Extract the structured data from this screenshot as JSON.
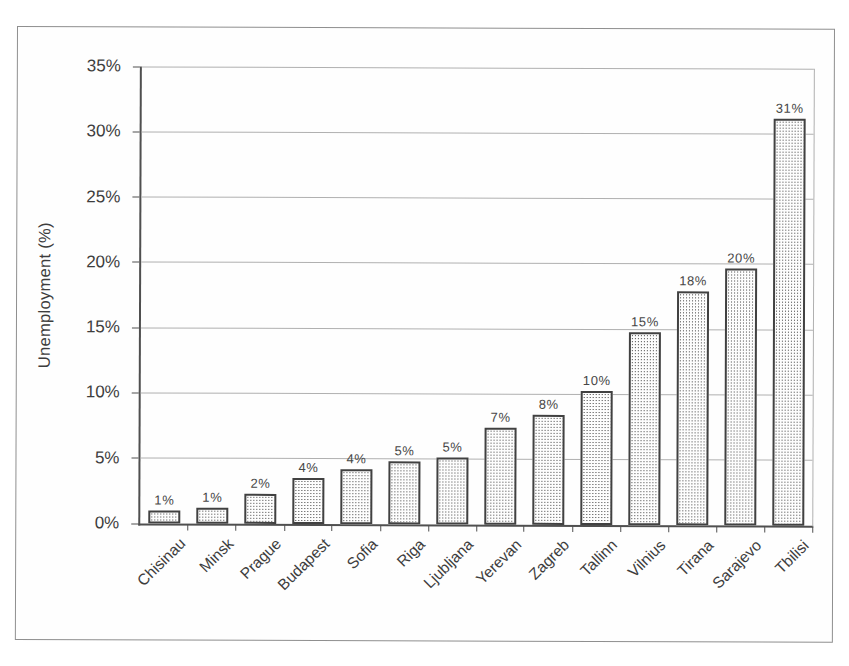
{
  "chart_data": {
    "type": "bar",
    "title": "",
    "xlabel": "",
    "ylabel": "Unemployment (%)",
    "categories": [
      "Chisinau",
      "Minsk",
      "Prague",
      "Budapest",
      "Sofia",
      "Riga",
      "Ljubljana",
      "Yerevan",
      "Zagreb",
      "Tallinn",
      "Vilnius",
      "Tirana",
      "Sarajevo",
      "Tbilisi"
    ],
    "values": [
      1,
      1,
      2,
      4,
      4,
      5,
      5,
      7,
      8,
      10,
      15,
      18,
      20,
      31
    ],
    "bar_labels": [
      "1%",
      "1%",
      "2%",
      "4%",
      "4%",
      "5%",
      "5%",
      "7%",
      "8%",
      "10%",
      "15%",
      "18%",
      "20%",
      "31%"
    ],
    "display_heights": [
      1.0,
      1.2,
      2.3,
      3.5,
      4.2,
      4.8,
      5.1,
      7.4,
      8.4,
      10.3,
      14.8,
      17.9,
      19.7,
      31.2
    ],
    "ylim": [
      0,
      35
    ],
    "y_tick_step": 5,
    "y_tick_labels": [
      "0%",
      "5%",
      "10%",
      "15%",
      "20%",
      "25%",
      "30%",
      "35%"
    ],
    "grid": true,
    "legend": "none",
    "bar_fill": "dotted-pattern",
    "colors": {
      "bar_border": "#414141",
      "bar_dot": "#3f3f3f",
      "bar_background": "#fdfdfd",
      "gridline": "#b0b0b0",
      "axis": "#4f4f4f",
      "text": "#3d3d3d",
      "frame_border": "#8f8f8f"
    }
  }
}
